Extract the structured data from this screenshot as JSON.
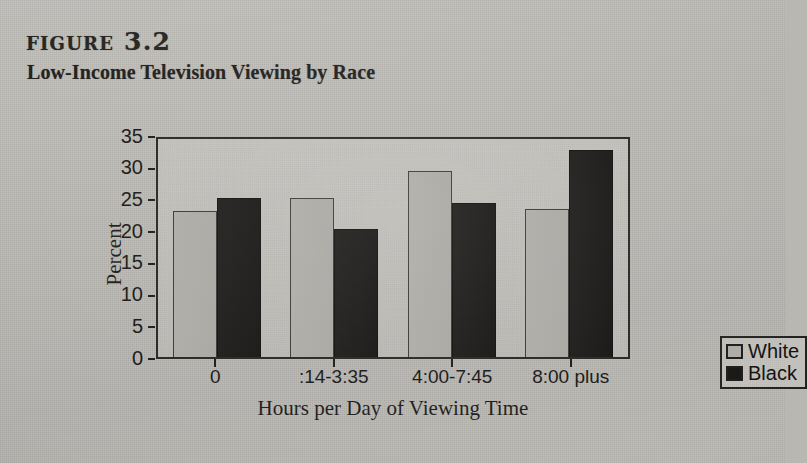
{
  "figure": {
    "label": "figure 3.2",
    "subtitle": "Low-Income Television Viewing by Race"
  },
  "legend": {
    "items": [
      {
        "label": "White",
        "color": "#adaba6",
        "swatch_icon": "legend-swatch-white"
      },
      {
        "label": "Black",
        "color": "#171615",
        "swatch_icon": "legend-swatch-black"
      }
    ]
  },
  "chart_data": {
    "type": "bar",
    "title": "Low-Income Television Viewing by Race",
    "xlabel": "Hours per Day of Viewing Time",
    "ylabel": "Percent",
    "categories": [
      "0",
      ":14-3:35",
      "4:00-7:45",
      "8:00 plus"
    ],
    "series": [
      {
        "name": "White",
        "color": "#adaba6",
        "values": [
          23.0,
          25.1,
          29.4,
          23.3
        ]
      },
      {
        "name": "Black",
        "color": "#171615",
        "values": [
          25.1,
          20.2,
          24.3,
          32.6
        ]
      }
    ],
    "ylim": [
      0,
      35
    ],
    "yticks": [
      0,
      5,
      10,
      15,
      20,
      25,
      30,
      35
    ],
    "ytick_labels": [
      "0",
      "5",
      "10",
      "15",
      "20",
      "25",
      "30",
      "35"
    ],
    "grid": false,
    "legend_position": "right"
  }
}
